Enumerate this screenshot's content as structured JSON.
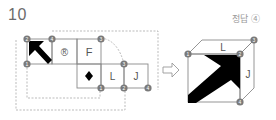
{
  "question": {
    "number": "10"
  },
  "answer": {
    "label": "정답 ④"
  },
  "net": {
    "faces": [
      {
        "id": "arrow-face",
        "symbol": "arrow-up-left"
      },
      {
        "id": "r-face",
        "text": "®"
      },
      {
        "id": "f-face",
        "text": "F"
      },
      {
        "id": "diamond-face",
        "text": "◆"
      },
      {
        "id": "l-face",
        "text": "L"
      },
      {
        "id": "j-face",
        "text": "J"
      }
    ],
    "vertex_labels": [
      "1",
      "2",
      "3",
      "4"
    ]
  },
  "transform_arrow": "⇨",
  "cube": {
    "top_face": "L",
    "right_face": "J",
    "front_face_symbol": "arrow-up-right",
    "vertices": [
      "1",
      "2",
      "3",
      "4"
    ]
  },
  "colors": {
    "line": "#8a8a8a",
    "dash": "#a8a8a8",
    "badge": "#7a7a7a",
    "fill": "#000000",
    "text": "#555555"
  }
}
